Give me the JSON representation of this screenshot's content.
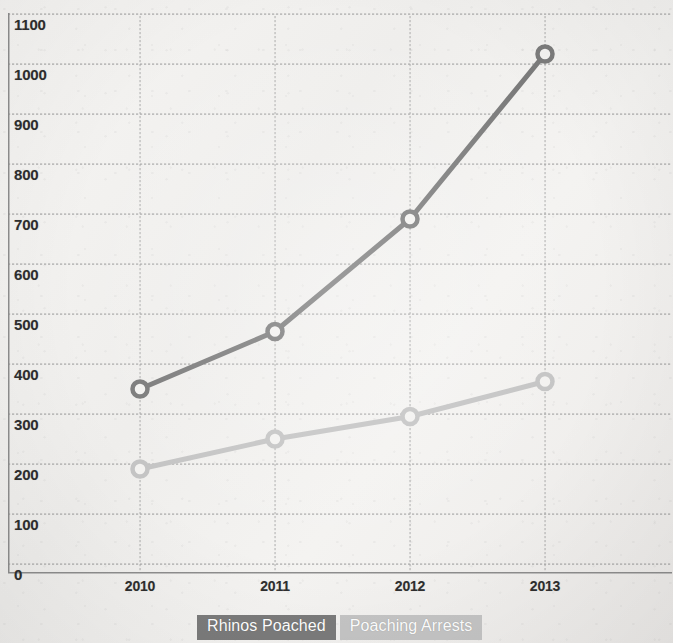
{
  "chart_data": {
    "type": "line",
    "title": "",
    "xlabel": "",
    "ylabel": "",
    "categories": [
      "2010",
      "2011",
      "2012",
      "2013"
    ],
    "ylim": [
      0,
      1100
    ],
    "ytick_step": 100,
    "yticks": [
      "1100",
      "1000",
      "900",
      "800",
      "700",
      "600",
      "500",
      "400",
      "300",
      "200",
      "100",
      "0"
    ],
    "grid": true,
    "legend_position": "bottom",
    "series": [
      {
        "name": "Rhinos Poached",
        "color": "#7b7b7b",
        "marker": "open-circle",
        "values": [
          350,
          465,
          690,
          1020
        ]
      },
      {
        "name": "Poaching Arrests",
        "color": "#c4c4c4",
        "marker": "open-circle",
        "values": [
          190,
          250,
          295,
          365
        ]
      }
    ]
  },
  "legend": {
    "items": [
      {
        "label": "Rhinos Poached",
        "color": "#7b7b7b"
      },
      {
        "label": "Poaching Arrests",
        "color": "#c4c4c4"
      }
    ]
  }
}
